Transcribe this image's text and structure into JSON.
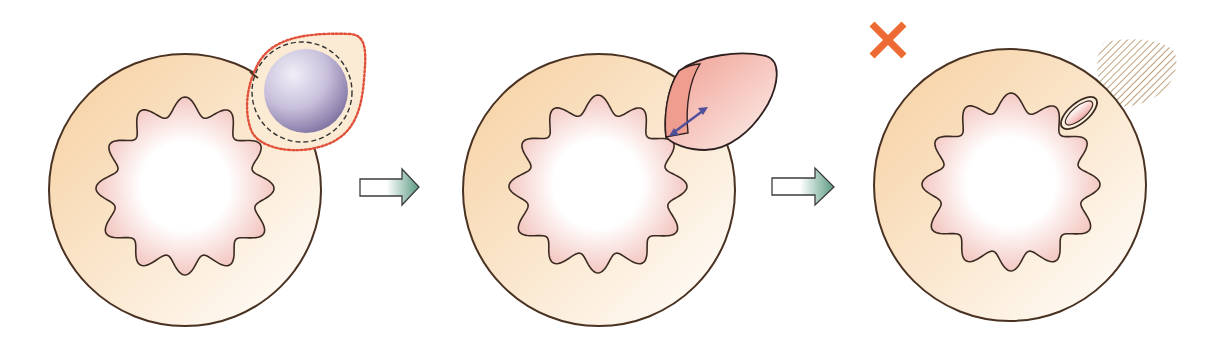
{
  "diagram": {
    "type": "three-step cell interaction sequence",
    "panels": [
      {
        "id": "panel-1",
        "description": "Large target cell with lobed nucleus; small purple cell attached at upper right, surrounded by dashed black ring and red dotted teardrop outline",
        "elements": [
          "target-cell",
          "lobed-nucleus",
          "attached-purple-cell",
          "dashed-ring",
          "red-dotted-outline"
        ]
      },
      {
        "id": "panel-2",
        "description": "Large target cell with lobed nucleus; pink lobe-shaped structure on upper right with a blue double-headed arrow",
        "elements": [
          "target-cell",
          "lobed-nucleus",
          "pink-lobe",
          "double-arrow"
        ]
      },
      {
        "id": "panel-3",
        "description": "Large target cell with lobed nucleus; small pink ellipse near membrane, hatched faded blob outside, orange X mark at top left",
        "elements": [
          "orange-x-mark",
          "target-cell",
          "lobed-nucleus",
          "small-ellipse",
          "hatched-blob"
        ]
      }
    ],
    "arrows": [
      {
        "id": "step-arrow-1",
        "from": "panel-1",
        "to": "panel-2"
      },
      {
        "id": "step-arrow-2",
        "from": "panel-2",
        "to": "panel-3"
      }
    ],
    "colors": {
      "cell_fill_start": "#f7d9b0",
      "cell_fill_end": "#fffaf2",
      "cell_outline": "#4a3222",
      "nucleus_fill": "#f3c5c0",
      "nucleus_center": "#ffffff",
      "purple_cell_light": "#e6e2ef",
      "purple_cell_dark": "#7e739c",
      "dashed_ring": "#333333",
      "dotted_outline": "#e0503a",
      "pink_lobe": "#f2a99e",
      "double_arrow": "#4f4f9a",
      "step_arrow_start": "#ffffff",
      "step_arrow_end": "#5e9c84",
      "x_mark": "#ee6a35",
      "hatch": "#c2a57e"
    }
  }
}
